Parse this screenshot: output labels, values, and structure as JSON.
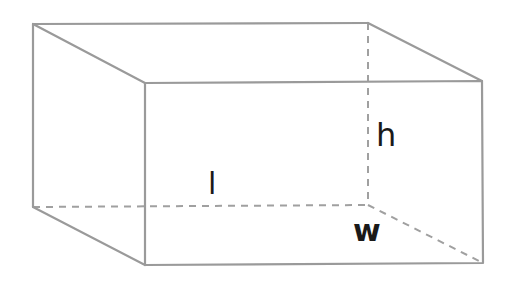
{
  "diagram": {
    "colors": {
      "edge": "#9a9a9a",
      "hidden_edge": "#a0a0a0",
      "label": "#1a1a1a",
      "background": "#ffffff"
    },
    "vertices": {
      "back_top_left": [
        33,
        24
      ],
      "back_top_right": [
        368,
        23
      ],
      "back_bottom_left": [
        33,
        207
      ],
      "back_bottom_right": [
        368,
        205
      ],
      "front_top_left": [
        145,
        83
      ],
      "front_top_right": [
        482,
        81
      ],
      "front_bottom_left": [
        145,
        265
      ],
      "front_bottom_right": [
        483,
        263
      ]
    },
    "labels": {
      "length": "l",
      "height": "h",
      "width": "w"
    }
  }
}
